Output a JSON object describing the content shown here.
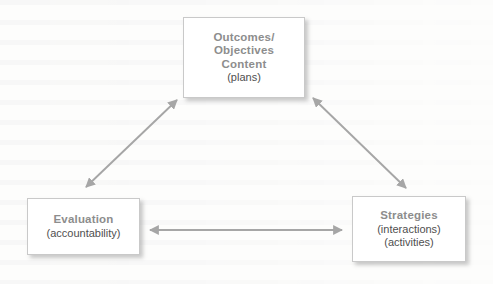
{
  "diagram": {
    "type": "triangle-relationship-diagram",
    "background_color": "#fdfdfc",
    "box_fill_color": "#ffffff",
    "box_border_color": "#c9c9c9",
    "title_color": "#8d8d8d",
    "subtitle_color": "#4f4f4f",
    "arrow_color": "#a6a6a6",
    "nodes": [
      {
        "id": "outcomes",
        "title_lines": [
          "Outcomes/",
          "Objectives",
          "Content"
        ],
        "sub_lines": [
          "(plans)"
        ]
      },
      {
        "id": "evaluation",
        "title_lines": [
          "Evaluation"
        ],
        "sub_lines": [
          "(accountability)"
        ]
      },
      {
        "id": "strategies",
        "title_lines": [
          "Strategies"
        ],
        "sub_lines": [
          "(interactions)",
          "(activities)"
        ]
      }
    ],
    "connectors": [
      {
        "id": "evaluation-outcomes",
        "from": "evaluation",
        "to": "outcomes",
        "style": "double-headed-arrow"
      },
      {
        "id": "outcomes-strategies",
        "from": "outcomes",
        "to": "strategies",
        "style": "double-headed-arrow"
      },
      {
        "id": "evaluation-strategies",
        "from": "evaluation",
        "to": "strategies",
        "style": "double-headed-arrow"
      }
    ]
  },
  "text": {
    "outcomes_line1": "Outcomes/",
    "outcomes_line2": "Objectives",
    "outcomes_line3": "Content",
    "outcomes_sub1": "(plans)",
    "evaluation_line1": "Evaluation",
    "evaluation_sub1": "(accountability)",
    "strategies_line1": "Strategies",
    "strategies_sub1": "(interactions)",
    "strategies_sub2": "(activities)"
  }
}
